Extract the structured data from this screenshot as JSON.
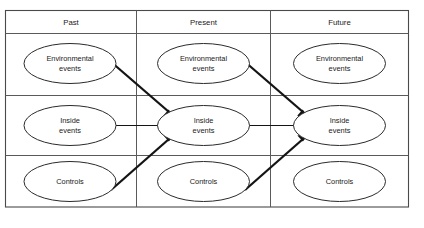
{
  "diagram": {
    "type": "flow-grid",
    "background_color": "#ffffff",
    "line_color": "#4a4a4a",
    "arrow_color": "#141414",
    "columns": [
      {
        "id": "past",
        "label": "Past"
      },
      {
        "id": "present",
        "label": "Present"
      },
      {
        "id": "future",
        "label": "Future"
      }
    ],
    "rows": [
      {
        "id": "environmental",
        "label_line1": "Environmental",
        "label_line2": "events"
      },
      {
        "id": "inside",
        "label_line1": "Inside",
        "label_line2": "events"
      },
      {
        "id": "controls",
        "label_line1": "Controls",
        "label_line2": ""
      }
    ],
    "nodes": [
      {
        "id": "past-environmental",
        "column": "Past",
        "row": "Environmental events",
        "line1": "Environmental",
        "line2": "events"
      },
      {
        "id": "past-inside",
        "column": "Past",
        "row": "Inside events",
        "line1": "Inside",
        "line2": "events"
      },
      {
        "id": "past-controls",
        "column": "Past",
        "row": "Controls",
        "line1": "Controls",
        "line2": ""
      },
      {
        "id": "present-environmental",
        "column": "Present",
        "row": "Environmental events",
        "line1": "Environmental",
        "line2": "events"
      },
      {
        "id": "present-inside",
        "column": "Present",
        "row": "Inside events",
        "line1": "Inside",
        "line2": "events"
      },
      {
        "id": "present-controls",
        "column": "Present",
        "row": "Controls",
        "line1": "Controls",
        "line2": ""
      },
      {
        "id": "future-environmental",
        "column": "Future",
        "row": "Environmental events",
        "line1": "Environmental",
        "line2": "events"
      },
      {
        "id": "future-inside",
        "column": "Future",
        "row": "Inside events",
        "line1": "Inside",
        "line2": "events"
      },
      {
        "id": "future-controls",
        "column": "Future",
        "row": "Controls",
        "line1": "Controls",
        "line2": ""
      }
    ],
    "arrows": [
      {
        "id": "arrow-past-env-to-present-inside",
        "from": "past-environmental",
        "to": "present-inside",
        "style": "thick-diagonal"
      },
      {
        "id": "arrow-past-inside-to-present-inside",
        "from": "past-inside",
        "to": "present-inside",
        "style": "thin-horizontal"
      },
      {
        "id": "arrow-past-controls-to-present-inside",
        "from": "past-controls",
        "to": "present-inside",
        "style": "thick-diagonal"
      },
      {
        "id": "arrow-present-env-to-future-inside",
        "from": "present-environmental",
        "to": "future-inside",
        "style": "thick-diagonal"
      },
      {
        "id": "arrow-present-inside-to-future-inside",
        "from": "present-inside",
        "to": "future-inside",
        "style": "thin-horizontal"
      },
      {
        "id": "arrow-present-controls-to-future-inside",
        "from": "present-controls",
        "to": "future-inside",
        "style": "thick-diagonal"
      }
    ]
  }
}
